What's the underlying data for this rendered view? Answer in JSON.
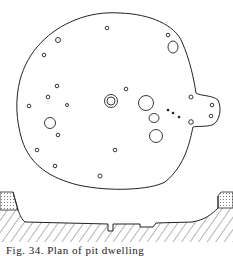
{
  "figure": {
    "type": "archaeological plan and section drawing",
    "plan_label": "plan view",
    "section_label": "cross-section profile",
    "caption": "Fig. 34.  Plan  of  pit  dwelling",
    "line_color": "#222222",
    "background": "#ffffff"
  }
}
